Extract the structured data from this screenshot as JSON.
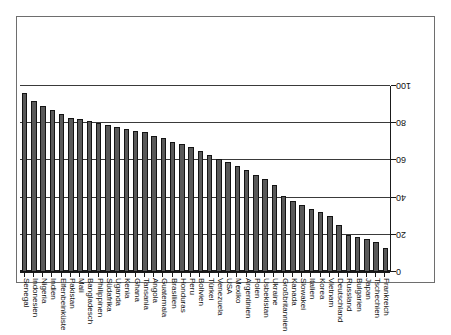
{
  "chart_data": {
    "type": "bar",
    "title": "",
    "subtitle": "",
    "xlabel": "",
    "ylabel": "",
    "orientation": "vertical",
    "rotated_180": true,
    "ylim": [
      0,
      100
    ],
    "yticks": [
      0,
      20,
      40,
      60,
      80,
      100
    ],
    "ytick_labels": [
      "0",
      "20",
      "40",
      "60",
      "80",
      "100"
    ],
    "grid": true,
    "grid_axis": "y",
    "legend": "none",
    "bar_color": "#595959",
    "bar_edge_color": "#141414",
    "axis_color": "#1a1a1a",
    "frame_color": "#6e6e6e",
    "categories": [
      "Frankreich",
      "Tschechien",
      "Japan",
      "Bulgarien",
      "Russland",
      "Deutschland",
      "Vietnam",
      "Korea",
      "Italien",
      "Slowakei",
      "Kanada",
      "Großbritannien",
      "Ukraine",
      "Usbekistan",
      "Polen",
      "Argentinien",
      "Mexiko",
      "USA",
      "Venezuela",
      "Türkei",
      "Bolivien",
      "Peru",
      "Honduras",
      "Brasilien",
      "Guatemala",
      "Angola",
      "Tansania",
      "Ghana",
      "Kenia",
      "Uganda",
      "Südafrika",
      "Philippinen",
      "Bangladesch",
      "Mali",
      "Pakistan",
      "Elfenbeinküste",
      "Indien",
      "Nigeria",
      "Indonesien",
      "Senegal"
    ],
    "values": [
      13,
      16,
      18,
      19,
      20,
      25,
      30,
      32,
      34,
      36,
      38,
      41,
      47,
      50,
      52,
      55,
      57,
      59,
      61,
      63,
      65,
      67,
      69,
      70,
      72,
      73,
      75,
      76,
      77,
      78,
      79,
      80,
      81,
      82,
      83,
      85,
      87,
      89,
      92,
      96
    ]
  }
}
